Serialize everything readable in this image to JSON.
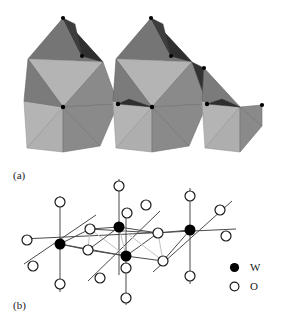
{
  "figure": {
    "panels": [
      {
        "id": "a",
        "label": "(a)",
        "representation": "polyhedral",
        "description": "corner-sharing WO6 octahedra"
      },
      {
        "id": "b",
        "label": "(b)",
        "representation": "ball-and-stick",
        "description": "W and O atoms with bonds"
      }
    ],
    "legend": {
      "items": [
        {
          "symbol": "W",
          "marker": "filled-circle",
          "color": "#000000"
        },
        {
          "symbol": "O",
          "marker": "open-circle",
          "color": "#ffffff"
        }
      ]
    },
    "colors": {
      "background": "#ffffff",
      "face_light": "#b4b4b4",
      "face_mid": "#8c8c8c",
      "face_dark": "#6e6e6e",
      "face_darkest": "#2b2b2b",
      "edge": "#3a3a3a",
      "vertex": "#000000",
      "bond": "#4a4a4a",
      "cell_line": "#b9b9b9",
      "atom_outline": "#1a1a1a",
      "text": "#1a1a1a"
    },
    "structure_data": {
      "type": "crystal-structure",
      "compound": "WO3",
      "panel_a": {
        "octahedra_count": 5,
        "connectivity": "corner-sharing",
        "centers": [
          {
            "cx": 63,
            "cy": 107
          },
          {
            "cx": 103,
            "cy": 62
          },
          {
            "cx": 152,
            "cy": 107
          },
          {
            "cx": 192,
            "cy": 62
          },
          {
            "cx": 240,
            "cy": 107
          }
        ]
      },
      "panel_b": {
        "w_atoms": [
          {
            "x": 60,
            "y": 244
          },
          {
            "x": 119,
            "y": 227
          },
          {
            "x": 126,
            "y": 256
          },
          {
            "x": 190,
            "y": 236
          }
        ],
        "o_atom_radius": 5,
        "w_atom_radius": 5.5,
        "coordination": 6
      }
    }
  }
}
